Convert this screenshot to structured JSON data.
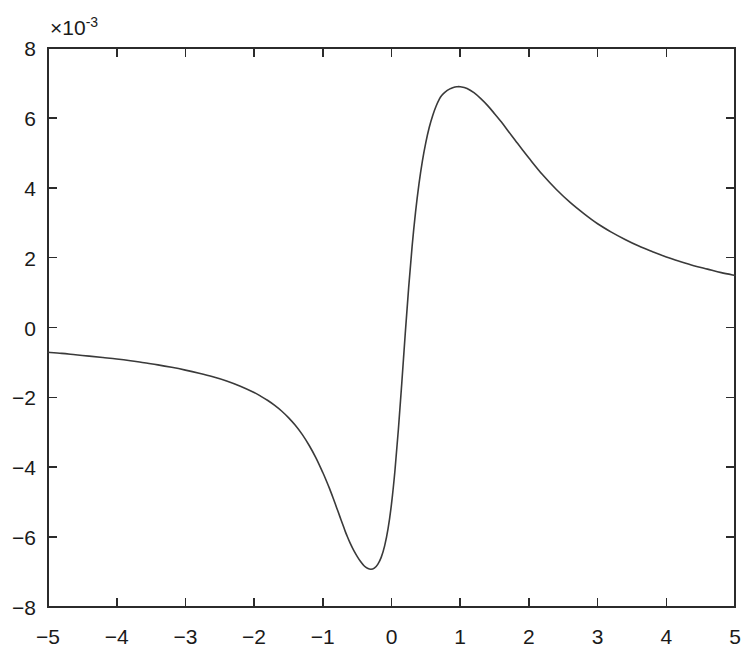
{
  "figure": {
    "background_color": "#ffffff",
    "axis_color": "#2b2b2b",
    "curve_color": "#3a3a3a"
  },
  "chart_data": {
    "type": "line",
    "title": "",
    "subtitle": "",
    "xlabel": "",
    "ylabel": "",
    "y_multiplier_label": "×10",
    "y_multiplier_exponent": "-3",
    "y_multiplier_value": 0.001,
    "xlim": [
      -5,
      5
    ],
    "ylim": [
      -8,
      8
    ],
    "xticks": [
      -5,
      -4,
      -3,
      -2,
      -1,
      0,
      1,
      2,
      3,
      4,
      5
    ],
    "xtick_labels": [
      "-5",
      "-4",
      "-3",
      "-2",
      "-1",
      "0",
      "1",
      "2",
      "3",
      "4",
      "5"
    ],
    "yticks": [
      -8,
      -6,
      -4,
      -2,
      0,
      2,
      4,
      6,
      8
    ],
    "ytick_labels": [
      "-8",
      "-6",
      "-4",
      "-2",
      "0",
      "2",
      "4",
      "6",
      "8"
    ],
    "grid": false,
    "legend": false,
    "legend_position": "none",
    "tick_direction": "in",
    "box": true,
    "annotations": [],
    "series": [
      {
        "name": "curve",
        "color": "#3a3a3a",
        "linewidth": 1.6,
        "x": [
          -5.0,
          -4.8,
          -4.6,
          -4.4,
          -4.2,
          -4.0,
          -3.8,
          -3.6,
          -3.4,
          -3.2,
          -3.0,
          -2.8,
          -2.6,
          -2.4,
          -2.2,
          -2.0,
          -1.9,
          -1.8,
          -1.7,
          -1.6,
          -1.5,
          -1.4,
          -1.3,
          -1.2,
          -1.1,
          -1.0,
          -0.95,
          -0.9,
          -0.85,
          -0.8,
          -0.75,
          -0.7,
          -0.68,
          -0.65,
          -0.6,
          -0.55,
          -0.5,
          -0.45,
          -0.4,
          -0.35,
          -0.3,
          -0.25,
          -0.2,
          -0.15,
          -0.1,
          -0.05,
          0.0,
          0.05,
          0.1,
          0.15,
          0.2,
          0.25,
          0.3,
          0.35,
          0.4,
          0.45,
          0.5,
          0.55,
          0.6,
          0.65,
          0.7,
          0.73,
          0.78,
          0.85,
          0.9,
          0.95,
          1.0,
          1.1,
          1.2,
          1.3,
          1.4,
          1.5,
          1.6,
          1.7,
          1.8,
          1.9,
          2.0,
          2.2,
          2.4,
          2.6,
          2.8,
          3.0,
          3.2,
          3.4,
          3.6,
          3.8,
          4.0,
          4.2,
          4.4,
          4.6,
          4.8,
          5.0
        ],
        "y": [
          -0.71,
          -0.74,
          -0.78,
          -0.82,
          -0.86,
          -0.9,
          -0.95,
          -1.01,
          -1.07,
          -1.14,
          -1.22,
          -1.31,
          -1.41,
          -1.53,
          -1.68,
          -1.86,
          -1.97,
          -2.09,
          -2.23,
          -2.39,
          -2.58,
          -2.8,
          -3.06,
          -3.37,
          -3.73,
          -4.15,
          -4.38,
          -4.62,
          -4.88,
          -5.15,
          -5.42,
          -5.69,
          -5.8,
          -5.95,
          -6.18,
          -6.38,
          -6.55,
          -6.7,
          -6.82,
          -6.89,
          -6.92,
          -6.89,
          -6.78,
          -6.58,
          -6.25,
          -5.76,
          -5.05,
          -4.1,
          -2.92,
          -1.58,
          -0.18,
          1.15,
          2.32,
          3.3,
          4.11,
          4.77,
          5.3,
          5.73,
          6.07,
          6.34,
          6.55,
          6.64,
          6.74,
          6.83,
          6.87,
          6.89,
          6.89,
          6.84,
          6.72,
          6.55,
          6.35,
          6.12,
          5.88,
          5.62,
          5.36,
          5.1,
          4.85,
          4.37,
          3.95,
          3.58,
          3.26,
          2.97,
          2.73,
          2.52,
          2.33,
          2.17,
          2.02,
          1.89,
          1.77,
          1.67,
          1.57,
          1.49
        ],
        "y_units": "×10⁻³",
        "extrema": [
          {
            "label": "minimum",
            "x": -0.68,
            "y": -6.94
          },
          {
            "label": "maximum",
            "x": 0.75,
            "y": 6.9
          }
        ],
        "zero_crossing_x": 0.2,
        "endpoints": [
          {
            "x": -5.0,
            "y": -0.71
          },
          {
            "x": 5.0,
            "y": 0.63
          }
        ]
      }
    ]
  }
}
